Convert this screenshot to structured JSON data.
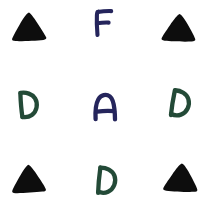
{
  "canvas": {
    "width": 211,
    "height": 203,
    "background_color": "#ffffff",
    "description": "Hand-drawn symbol grid, 3 rows by 3 columns"
  },
  "palette": {
    "black": "#0d0d0d",
    "navy": "#25255c",
    "green": "#234a37"
  },
  "grid": {
    "rows": 3,
    "columns": 3,
    "cells": [
      {
        "id": "r1c1",
        "row": 1,
        "column": 1,
        "symbol": "triangle",
        "label": "",
        "color": "#0d0d0d",
        "color_name": "black",
        "fill": "solid",
        "rotation": -2,
        "x": 28,
        "y": 28
      },
      {
        "id": "r1c2",
        "row": 1,
        "column": 2,
        "symbol": "letter",
        "label": "F",
        "color": "#25255c",
        "color_name": "navy",
        "fill": "stroke",
        "rotation": 0,
        "x": 103,
        "y": 23
      },
      {
        "id": "r1c3",
        "row": 1,
        "column": 3,
        "symbol": "triangle",
        "label": "",
        "color": "#0d0d0d",
        "color_name": "black",
        "fill": "solid",
        "rotation": 2,
        "x": 178,
        "y": 29
      },
      {
        "id": "r2c1",
        "row": 2,
        "column": 1,
        "symbol": "letter",
        "label": "D",
        "color": "#234a37",
        "color_name": "green",
        "fill": "stroke",
        "rotation": -4,
        "x": 26,
        "y": 105
      },
      {
        "id": "r2c2",
        "row": 2,
        "column": 2,
        "symbol": "letter",
        "label": "A",
        "color": "#25255c",
        "color_name": "navy",
        "fill": "stroke",
        "rotation": 0,
        "x": 105,
        "y": 107
      },
      {
        "id": "r2c3",
        "row": 2,
        "column": 3,
        "symbol": "letter",
        "label": "D",
        "color": "#234a37",
        "color_name": "green",
        "fill": "stroke",
        "rotation": 10,
        "x": 179,
        "y": 104
      },
      {
        "id": "r3c1",
        "row": 3,
        "column": 1,
        "symbol": "triangle",
        "label": "",
        "color": "#0d0d0d",
        "color_name": "black",
        "fill": "solid",
        "rotation": -3,
        "x": 29,
        "y": 181
      },
      {
        "id": "r3c2",
        "row": 3,
        "column": 2,
        "symbol": "letter",
        "label": "D",
        "color": "#234a37",
        "color_name": "green",
        "fill": "stroke",
        "rotation": 6,
        "x": 105,
        "y": 181
      },
      {
        "id": "r3c3",
        "row": 3,
        "column": 3,
        "symbol": "triangle",
        "label": "",
        "color": "#0d0d0d",
        "color_name": "black",
        "fill": "solid",
        "rotation": 3,
        "x": 181,
        "y": 180
      }
    ]
  }
}
